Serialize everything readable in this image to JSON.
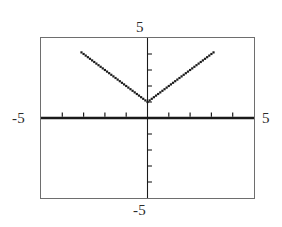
{
  "window": {
    "title": "Graphing calculator plot",
    "background_color": "#ffffff",
    "frame_color": "#6e6e6e",
    "ink_color": "#1a1a1a"
  },
  "labels": {
    "ymax": "5",
    "ymin": "-5",
    "xmin": "-5",
    "xmax": "5"
  },
  "chart_data": {
    "type": "scatter",
    "title": "",
    "xlabel": "",
    "ylabel": "",
    "xlim": [
      -5,
      5
    ],
    "ylim": [
      -5,
      5
    ],
    "grid": false,
    "legend": null,
    "axes": {
      "x_axis_y_value": 0,
      "y_axis_x_value": 0,
      "x_axis_style": "thick-solid",
      "y_axis_style": "thin-solid",
      "tick_interval": 1,
      "x_ticks": [
        -4,
        -3,
        -2,
        -1,
        1,
        2,
        3,
        4
      ],
      "y_ticks": [
        -4,
        -3,
        -2,
        -1,
        1,
        2,
        3,
        4
      ],
      "tick_direction_x": "up",
      "tick_direction_y": "right"
    },
    "series": [
      {
        "name": "y = |x| + 1",
        "marker": "dot",
        "marker_size": 2.2,
        "color": "#1a1a1a",
        "vertex": [
          0,
          1
        ],
        "slope_left": -1,
        "slope_right": 1,
        "x_start": -3.1,
        "x_end": 3.1,
        "point_count": 63,
        "x": [
          -3.1,
          -3,
          -2.9,
          -2.8,
          -2.7,
          -2.6,
          -2.5,
          -2.4,
          -2.3,
          -2.2,
          -2.1,
          -2,
          -1.9,
          -1.8,
          -1.7,
          -1.6,
          -1.5,
          -1.4,
          -1.3,
          -1.2,
          -1.1,
          -1,
          -0.9,
          -0.8,
          -0.7,
          -0.6,
          -0.5,
          -0.4,
          -0.3,
          -0.2,
          -0.1,
          0,
          0.1,
          0.2,
          0.3,
          0.4,
          0.5,
          0.6,
          0.7,
          0.8,
          0.9,
          1,
          1.1,
          1.2,
          1.3,
          1.4,
          1.5,
          1.6,
          1.7,
          1.8,
          1.9,
          2,
          2.1,
          2.2,
          2.3,
          2.4,
          2.5,
          2.6,
          2.7,
          2.8,
          2.9,
          3,
          3.1
        ],
        "y": [
          4.1,
          4,
          3.9,
          3.8,
          3.7,
          3.6,
          3.5,
          3.4,
          3.3,
          3.2,
          3.1,
          3,
          2.9,
          2.8,
          2.7,
          2.6,
          2.5,
          2.4,
          2.3,
          2.2,
          2.1,
          2,
          1.9,
          1.8,
          1.7,
          1.6,
          1.5,
          1.4,
          1.3,
          1.2,
          1.1,
          1,
          1.1,
          1.2,
          1.3,
          1.4,
          1.5,
          1.6,
          1.7,
          1.8,
          1.9,
          2,
          2.1,
          2.2,
          2.3,
          2.4,
          2.5,
          2.6,
          2.7,
          2.8,
          2.9,
          3,
          3.1,
          3.2,
          3.3,
          3.4,
          3.5,
          3.6,
          3.7,
          3.8,
          3.9,
          4,
          4.1
        ]
      }
    ]
  }
}
